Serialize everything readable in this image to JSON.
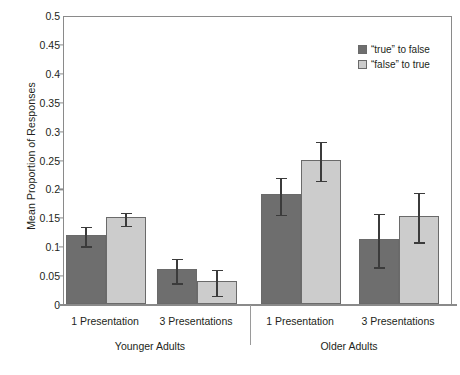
{
  "chart_data": {
    "type": "bar",
    "title": "",
    "xlabel": "",
    "ylabel": "Mean Proportion of Responses",
    "ylim": [
      0,
      0.5
    ],
    "ytick_step": 0.05,
    "yticks": [
      "0.5",
      "0.45",
      "0.4",
      "0.35",
      "0.3",
      "0.25",
      "0.2",
      "0.15",
      "0.1",
      "0.05",
      "0"
    ],
    "grid": false,
    "legend_position": "top-right",
    "categories": [
      "1 Presentation",
      "3 Presentations",
      "1 Presentation",
      "3 Presentations"
    ],
    "group_labels": [
      "Younger Adults",
      "Older Adults"
    ],
    "series": [
      {
        "name": "“true” to false",
        "color": "#6e6e6e",
        "values": [
          0.12,
          0.06,
          0.19,
          0.113
        ],
        "errors": [
          0.017,
          0.021,
          0.032,
          0.046
        ]
      },
      {
        "name": "“false” to true",
        "color": "#cccccc",
        "values": [
          0.15,
          0.04,
          0.25,
          0.153
        ],
        "errors": [
          0.011,
          0.022,
          0.034,
          0.043
        ]
      }
    ]
  },
  "legend": {
    "items": [
      {
        "label": "“true” to false",
        "color": "#6e6e6e"
      },
      {
        "label": "“false” to true",
        "color": "#cccccc"
      }
    ]
  },
  "axis": {
    "y_title": "Mean Proportion of Responses"
  },
  "colors": {
    "series_dark": "#6e6e6e",
    "series_light": "#cccccc",
    "axis": "#8a8a8a",
    "text": "#231f20",
    "error": "#3b3b3b"
  }
}
